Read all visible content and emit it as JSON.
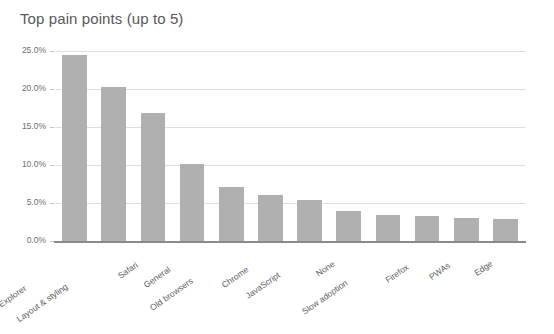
{
  "chart_data": {
    "type": "bar",
    "title": "Top pain points (up to 5)",
    "xlabel": "",
    "ylabel": "",
    "ylim": [
      0,
      25
    ],
    "ytick_labels": [
      "25.0%",
      "20.0%",
      "15.0%",
      "10.0%",
      "5.0%",
      "0.0%"
    ],
    "ytick_values": [
      25,
      20,
      15,
      10,
      5,
      0
    ],
    "grid": true,
    "legend": false,
    "bar_color": "#b0b0b0",
    "categories": [
      "Internet Explorer",
      "Layout & styling",
      "Safari",
      "General",
      "Old browsers",
      "Chrome",
      "JavaScript",
      "None",
      "Slow adoption",
      "Firefox",
      "PWAs",
      "Edge"
    ],
    "values": [
      24.5,
      20.3,
      16.9,
      10.1,
      7.1,
      6.0,
      5.4,
      3.9,
      3.4,
      3.3,
      3.0,
      2.9
    ]
  }
}
